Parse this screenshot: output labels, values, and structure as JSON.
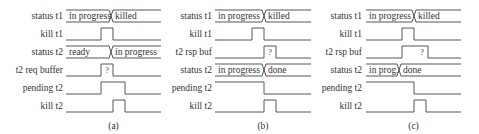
{
  "panels": [
    {
      "caption": "(a)",
      "x0": 66,
      "x1": 161,
      "label_x": 63,
      "rows": [
        {
          "label": "status t1",
          "type": "bus",
          "segments": [
            {
              "text": "in progress",
              "from": 66,
              "to": 111
            },
            {
              "text": "killed",
              "from": 111,
              "to": 161
            }
          ],
          "cross": [
            111
          ]
        },
        {
          "label": "kill t1",
          "type": "wave",
          "initial": 0,
          "edges": [
            101,
            113
          ]
        },
        {
          "label": "status t2",
          "type": "bus",
          "segments": [
            {
              "text": "ready",
              "from": 66,
              "to": 111
            },
            {
              "text": "in progress",
              "from": 111,
              "to": 161
            }
          ],
          "cross": [
            111
          ]
        },
        {
          "label": "t2 req buffer",
          "type": "wave",
          "initial": 0,
          "edges": [
            101,
            113
          ],
          "mark": {
            "text": "?",
            "x": 107
          }
        },
        {
          "label": "pending t2",
          "type": "wave",
          "initial": 0,
          "edges": [
            101,
            125
          ]
        },
        {
          "label": "kill t2",
          "type": "wave",
          "initial": 0,
          "edges": [
            113,
            125
          ]
        }
      ]
    },
    {
      "caption": "(b)",
      "x0": 215,
      "x1": 311,
      "label_x": 212,
      "rows": [
        {
          "label": "status t1",
          "type": "bus",
          "segments": [
            {
              "text": "in progress",
              "from": 215,
              "to": 264
            },
            {
              "text": "killed",
              "from": 264,
              "to": 311
            }
          ],
          "cross": [
            264
          ]
        },
        {
          "label": "kill t1",
          "type": "wave",
          "initial": 0,
          "edges": [
            252,
            264
          ]
        },
        {
          "label": "t2 rsp buf",
          "type": "wave",
          "initial": 0,
          "edges": [
            264,
            276
          ],
          "mark": {
            "text": "?",
            "x": 270
          }
        },
        {
          "label": "status t2",
          "type": "bus",
          "segments": [
            {
              "text": "in progress",
              "from": 215,
              "to": 264
            },
            {
              "text": "done",
              "from": 264,
              "to": 311
            }
          ],
          "cross": [
            264
          ]
        },
        {
          "label": "pending t2",
          "type": "wave",
          "initial": 1,
          "edges": [
            264
          ]
        },
        {
          "label": "kill t2",
          "type": "wave",
          "initial": 0,
          "edges": [
            264,
            276
          ]
        }
      ]
    },
    {
      "caption": "(c)",
      "x0": 366,
      "x1": 461,
      "label_x": 362,
      "rows": [
        {
          "label": "status t1",
          "type": "bus",
          "segments": [
            {
              "text": "in progress",
              "from": 366,
              "to": 414
            },
            {
              "text": "killed",
              "from": 414,
              "to": 461
            }
          ],
          "cross": [
            414
          ]
        },
        {
          "label": "kill t1",
          "type": "wave",
          "initial": 0,
          "edges": [
            402,
            414
          ]
        },
        {
          "label": "t2 rsp buf",
          "type": "wave",
          "initial": 0,
          "edges": [
            402,
            428
          ],
          "mark": {
            "text": "?",
            "x": 422
          }
        },
        {
          "label": "status t2",
          "type": "bus",
          "segments": [
            {
              "text": "in prog.",
              "from": 366,
              "to": 399
            },
            {
              "text": "done",
              "from": 399,
              "to": 461
            }
          ],
          "cross": [
            399
          ]
        },
        {
          "label": "pending t2",
          "type": "wave",
          "initial": 1,
          "edges": [
            414
          ]
        },
        {
          "label": "kill t2",
          "type": "wave",
          "initial": 0,
          "edges": [
            414,
            426
          ]
        }
      ]
    }
  ],
  "layout": {
    "row_tops": [
      10,
      28,
      46,
      64,
      82,
      100
    ],
    "row_height": 12,
    "caption_y": 129
  }
}
